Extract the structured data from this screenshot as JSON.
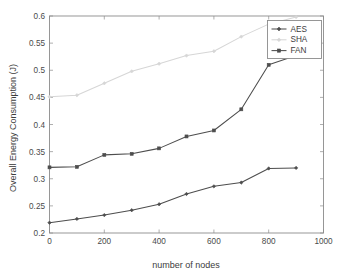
{
  "chart_data": {
    "type": "line",
    "title": "",
    "xlabel": "number of nodes",
    "ylabel": "Overall Energy Consumption (J)",
    "xlim": [
      0,
      1000
    ],
    "ylim": [
      0.2,
      0.6
    ],
    "xticks": [
      0,
      200,
      400,
      600,
      800,
      1000
    ],
    "xtick_labels": [
      "0",
      "200",
      "400",
      "600",
      "800",
      "1000"
    ],
    "yticks": [
      0.2,
      0.25,
      0.3,
      0.35,
      0.4,
      0.45,
      0.5,
      0.55,
      0.6
    ],
    "ytick_labels": [
      "0.2",
      "0.25",
      "0.3",
      "0.35",
      "0.4",
      "0.45",
      "0.5",
      "0.55",
      "0.6"
    ],
    "grid": false,
    "legend_position": "top-right",
    "x": [
      0,
      100,
      200,
      300,
      400,
      500,
      600,
      700,
      800,
      900
    ],
    "series": [
      {
        "name": "AES",
        "color": "#4d4d4d",
        "marker": "diamond",
        "values": [
          0.219,
          0.226,
          0.233,
          0.242,
          0.253,
          0.272,
          0.286,
          0.293,
          0.319,
          0.32
        ]
      },
      {
        "name": "SHA",
        "color": "#d6d6d6",
        "marker": "diamond",
        "values": [
          0.451,
          0.454,
          0.476,
          0.498,
          0.512,
          0.527,
          0.535,
          0.562,
          0.585,
          0.598
        ]
      },
      {
        "name": "FAN",
        "color": "#4d4d4d",
        "marker": "square",
        "values": [
          0.321,
          0.322,
          0.344,
          0.346,
          0.356,
          0.378,
          0.389,
          0.428,
          0.51,
          0.527
        ]
      }
    ]
  },
  "legend": {
    "entries": [
      "AES",
      "SHA",
      "FAN"
    ]
  },
  "axes": {
    "x_title": "number of nodes",
    "y_title": "Overall Energy Consumption (J)"
  }
}
